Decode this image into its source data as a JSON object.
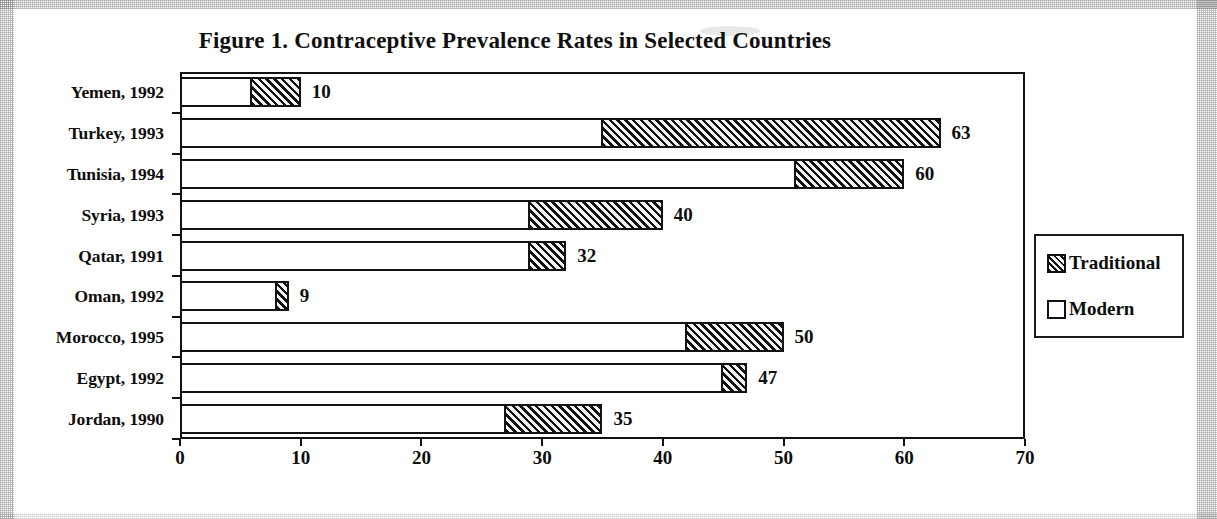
{
  "chart_data": {
    "type": "bar",
    "orientation": "horizontal",
    "stacked": true,
    "title": "Figure 1. Contraceptive Prevalence Rates in Selected Countries",
    "xlabel": "",
    "ylabel": "",
    "xlim": [
      0,
      70
    ],
    "xticks": [
      0,
      10,
      20,
      30,
      40,
      50,
      60,
      70
    ],
    "grid": false,
    "legend_position": "right",
    "categories": [
      "Yemen, 1992",
      "Turkey, 1993",
      "Tunisia, 1994",
      "Syria, 1993",
      "Qatar, 1991",
      "Oman, 1992",
      "Morocco, 1995",
      "Egypt, 1992",
      "Jordan, 1990"
    ],
    "series": [
      {
        "name": "Modern",
        "values": [
          6,
          35,
          51,
          29,
          29,
          8,
          42,
          45,
          27
        ]
      },
      {
        "name": "Traditional",
        "values": [
          4,
          28,
          9,
          11,
          3,
          1,
          8,
          2,
          8
        ]
      }
    ],
    "totals": [
      10,
      63,
      60,
      40,
      32,
      9,
      50,
      47,
      35
    ],
    "total_labels": [
      "10",
      "63",
      "60",
      "40",
      "32",
      "9",
      "50",
      "47",
      "35"
    ]
  },
  "legend": {
    "entries": [
      {
        "label": "Traditional",
        "swatch": "hatched-swatch"
      },
      {
        "label": "Modern",
        "swatch": "open-swatch"
      }
    ]
  }
}
